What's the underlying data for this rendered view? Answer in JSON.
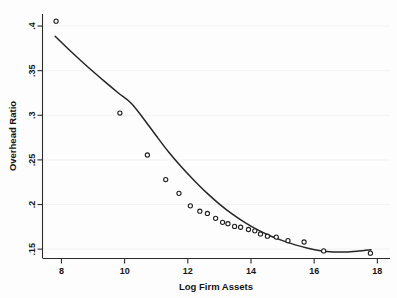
{
  "chart_data": {
    "type": "scatter",
    "title": "",
    "xlabel": "Log Firm Assets",
    "ylabel": "Overhead Ratio",
    "xlim": [
      7.4,
      18.4
    ],
    "ylim": [
      0.1395,
      0.4135
    ],
    "xticks": [
      8,
      10,
      12,
      14,
      16,
      18
    ],
    "xtick_labels": [
      "8",
      "10",
      "12",
      "14",
      "16",
      "18"
    ],
    "yticks": [
      0.15,
      0.2,
      0.25,
      0.3,
      0.35,
      0.4
    ],
    "ytick_labels": [
      ".15",
      ".2",
      ".25",
      ".3",
      ".35",
      ".4"
    ],
    "grid": false,
    "legend": "none",
    "series": [
      {
        "name": "Binned means",
        "type": "scatter",
        "marker": "open-circle",
        "points": [
          {
            "x": 7.83,
            "y": 0.4055
          },
          {
            "x": 9.85,
            "y": 0.3025
          },
          {
            "x": 10.72,
            "y": 0.2555
          },
          {
            "x": 11.3,
            "y": 0.228
          },
          {
            "x": 11.72,
            "y": 0.2125
          },
          {
            "x": 12.08,
            "y": 0.1985
          },
          {
            "x": 12.38,
            "y": 0.1925
          },
          {
            "x": 12.62,
            "y": 0.19
          },
          {
            "x": 12.88,
            "y": 0.1845
          },
          {
            "x": 13.1,
            "y": 0.18
          },
          {
            "x": 13.27,
            "y": 0.1785
          },
          {
            "x": 13.48,
            "y": 0.1755
          },
          {
            "x": 13.67,
            "y": 0.1745
          },
          {
            "x": 13.92,
            "y": 0.172
          },
          {
            "x": 14.12,
            "y": 0.1705
          },
          {
            "x": 14.3,
            "y": 0.167
          },
          {
            "x": 14.52,
            "y": 0.1645
          },
          {
            "x": 14.8,
            "y": 0.1635
          },
          {
            "x": 15.17,
            "y": 0.1595
          },
          {
            "x": 15.68,
            "y": 0.158
          },
          {
            "x": 16.3,
            "y": 0.148
          },
          {
            "x": 17.78,
            "y": 0.1455
          }
        ]
      },
      {
        "name": "Fitted quadratic",
        "type": "line",
        "points": [
          {
            "x": 7.8,
            "y": 0.3885
          },
          {
            "x": 8.2,
            "y": 0.3748
          },
          {
            "x": 8.6,
            "y": 0.3617
          },
          {
            "x": 9.0,
            "y": 0.349
          },
          {
            "x": 9.4,
            "y": 0.3368
          },
          {
            "x": 9.8,
            "y": 0.325
          },
          {
            "x": 10.2,
            "y": 0.3138
          },
          {
            "x": 10.6,
            "y": 0.2962
          },
          {
            "x": 11.0,
            "y": 0.277
          },
          {
            "x": 11.4,
            "y": 0.2585
          },
          {
            "x": 11.8,
            "y": 0.242
          },
          {
            "x": 12.2,
            "y": 0.227
          },
          {
            "x": 12.6,
            "y": 0.213
          },
          {
            "x": 13.0,
            "y": 0.2005
          },
          {
            "x": 13.4,
            "y": 0.1895
          },
          {
            "x": 13.8,
            "y": 0.18
          },
          {
            "x": 14.2,
            "y": 0.1718
          },
          {
            "x": 14.6,
            "y": 0.165
          },
          {
            "x": 15.0,
            "y": 0.1595
          },
          {
            "x": 15.4,
            "y": 0.1548
          },
          {
            "x": 15.8,
            "y": 0.151
          },
          {
            "x": 16.2,
            "y": 0.1482
          },
          {
            "x": 16.6,
            "y": 0.1468
          },
          {
            "x": 17.0,
            "y": 0.1468
          },
          {
            "x": 17.4,
            "y": 0.1478
          },
          {
            "x": 17.8,
            "y": 0.1492
          }
        ]
      }
    ]
  },
  "axes": {
    "x_title": "Log Firm Assets",
    "y_title": "Overhead Ratio"
  },
  "colors": {
    "background": "#fdfdfd",
    "axis": "#2b2b2b",
    "curve": "#262626",
    "marker_stroke": "#1f1f1f",
    "marker_fill": "#ffffff",
    "text": "#141414"
  }
}
